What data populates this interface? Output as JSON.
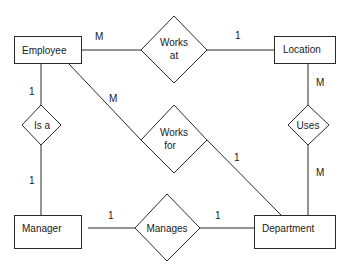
{
  "diagram": {
    "type": "entity-relationship",
    "entities": [
      {
        "id": "employee",
        "label": "Employee"
      },
      {
        "id": "location",
        "label": "Location"
      },
      {
        "id": "manager",
        "label": "Manager"
      },
      {
        "id": "department",
        "label": "Department"
      }
    ],
    "relationships": [
      {
        "id": "works_at",
        "line1": "Works",
        "line2": "at"
      },
      {
        "id": "works_for",
        "line1": "Works",
        "line2": "for"
      },
      {
        "id": "is_a",
        "line1": "Is a"
      },
      {
        "id": "uses",
        "line1": "Uses"
      },
      {
        "id": "manages",
        "line1": "Manages"
      }
    ],
    "cardinalities": {
      "employee_works_at": "M",
      "location_works_at": "1",
      "employee_works_for": "M",
      "department_works_for": "1",
      "employee_is_a": "1",
      "manager_is_a": "1",
      "location_uses": "M",
      "department_uses": "M",
      "manager_manages": "1",
      "department_manages": "1"
    }
  }
}
